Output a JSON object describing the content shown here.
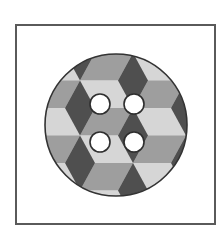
{
  "image": {
    "subject": "sewing button with tumbling-blocks pattern",
    "hole_count": 4
  },
  "colors": {
    "frame": "#5a5a5a",
    "button_outline": "#333333",
    "face_light": "#d6d6d6",
    "face_medium": "#9e9e9e",
    "face_dark": "#4f4f4f",
    "hole_fill": "#ffffff",
    "hole_outline": "#2e2e2e"
  }
}
